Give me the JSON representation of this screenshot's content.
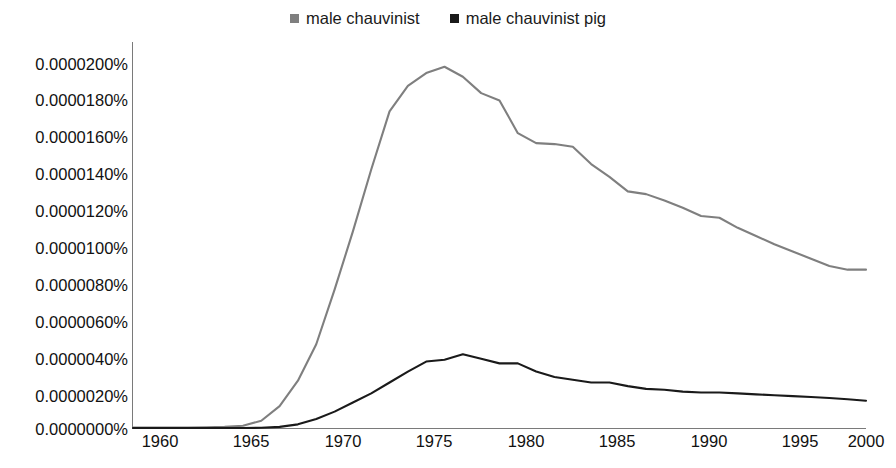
{
  "legend": {
    "position": "top-center",
    "entries": [
      {
        "label": "male chauvinist",
        "color": "#7f7f7f",
        "marker": "square"
      },
      {
        "label": "male chauvinist pig",
        "color": "#1a1a1a",
        "marker": "square"
      }
    ]
  },
  "axes": {
    "y_ticks": [
      "0.0000200%",
      "0.0000180%",
      "0.0000160%",
      "0.0000140%",
      "0.0000120%",
      "0.0000100%",
      "0.0000080%",
      "0.0000060%",
      "0.0000040%",
      "0.0000020%",
      "0.0000000%"
    ],
    "x_ticks": [
      "1960",
      "1965",
      "1970",
      "1975",
      "1980",
      "1985",
      "1990",
      "1995",
      "2000"
    ]
  },
  "chart_data": {
    "type": "line",
    "title": "",
    "subtitle": "",
    "xlabel": "",
    "ylabel": "",
    "xlim": [
      1960,
      2000
    ],
    "ylim": [
      0.0,
      2e-05
    ],
    "ytick_values": [
      2e-05,
      1.8e-05,
      1.6e-05,
      1.4e-05,
      1.2e-05,
      1e-05,
      8e-06,
      6e-06,
      4e-06,
      2e-06,
      0.0
    ],
    "xtick_values": [
      1960,
      1965,
      1970,
      1975,
      1980,
      1985,
      1990,
      1995,
      2000
    ],
    "grid": false,
    "legend_position": "top-center",
    "value_unit": "percent of all bigrams/trigrams",
    "x": [
      1960,
      1961,
      1962,
      1963,
      1964,
      1965,
      1966,
      1967,
      1968,
      1969,
      1970,
      1971,
      1972,
      1973,
      1974,
      1975,
      1976,
      1977,
      1978,
      1979,
      1980,
      1981,
      1982,
      1983,
      1984,
      1985,
      1986,
      1987,
      1988,
      1989,
      1990,
      1991,
      1992,
      1993,
      1994,
      1995,
      1996,
      1997,
      1998,
      1999,
      2000
    ],
    "series": [
      {
        "name": "male chauvinist",
        "color": "#7f7f7f",
        "values": [
          2e-08,
          2e-08,
          3e-08,
          3e-08,
          4e-08,
          6e-08,
          1.2e-07,
          4e-07,
          1.2e-06,
          2.6e-06,
          4.6e-06,
          7.6e-06,
          1.08e-05,
          1.42e-05,
          1.74e-05,
          1.88e-05,
          1.95e-05,
          1.985e-05,
          1.93e-05,
          1.84e-05,
          1.8e-05,
          1.62e-05,
          1.565e-05,
          1.56e-05,
          1.545e-05,
          1.45e-05,
          1.38e-05,
          1.3e-05,
          1.285e-05,
          1.25e-05,
          1.21e-05,
          1.165e-05,
          1.155e-05,
          1.1e-05,
          1.055e-05,
          1.01e-05,
          9.7e-06,
          9.3e-06,
          8.9e-06,
          8.7e-06,
          8.7e-06
        ]
      },
      {
        "name": "male chauvinist pig",
        "color": "#1a1a1a",
        "values": [
          0.0,
          0.0,
          0.0,
          0.0,
          0.0,
          0.0,
          0.0,
          1e-08,
          6e-08,
          2e-07,
          5e-07,
          9e-07,
          1.4e-06,
          1.9e-06,
          2.5e-06,
          3.1e-06,
          3.65e-06,
          3.75e-06,
          4.05e-06,
          3.8e-06,
          3.55e-06,
          3.55e-06,
          3.1e-06,
          2.8e-06,
          2.65e-06,
          2.5e-06,
          2.5e-06,
          2.3e-06,
          2.15e-06,
          2.1e-06,
          2e-06,
          1.95e-06,
          1.95e-06,
          1.9e-06,
          1.85e-06,
          1.8e-06,
          1.75e-06,
          1.7e-06,
          1.65e-06,
          1.58e-06,
          1.5e-06
        ]
      }
    ]
  }
}
